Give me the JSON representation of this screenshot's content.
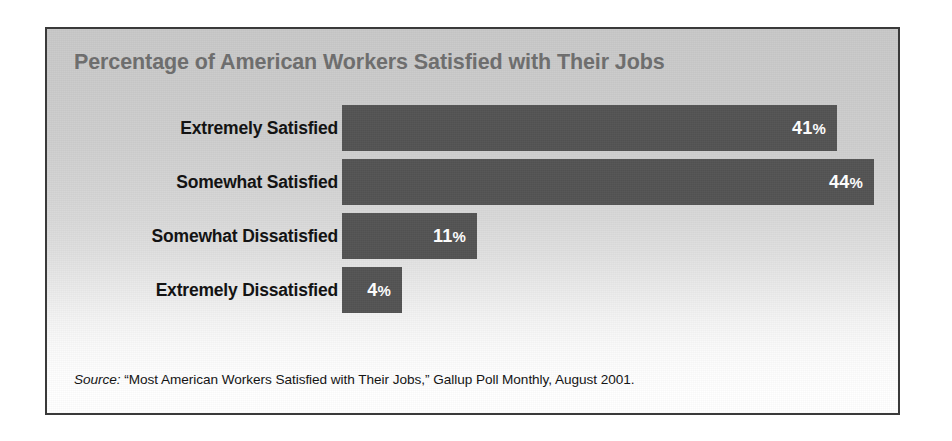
{
  "figure": {
    "title": "Percentage of American Workers Satisfied with Their Jobs",
    "source_label": "Source:",
    "source_text": " “Most American Workers Satisfied with Their Jobs,” Gallup Poll Monthly, August 2001.",
    "frame_color": "#3a3a3a",
    "title_color": "#6e6e6e",
    "bar_color": "#545454",
    "label_color": "#111111",
    "value_color": "#ffffff",
    "background_top": "#c9c9c9",
    "background_bottom": "#ffffff"
  },
  "chart_data": {
    "type": "bar",
    "orientation": "horizontal",
    "title": "Percentage of American Workers Satisfied with Their Jobs",
    "xlabel": "",
    "ylabel": "",
    "xlim": [
      0,
      50
    ],
    "grid": false,
    "legend": "none",
    "categories": [
      "Extremely Satisfied",
      "Somewhat Satisfied",
      "Somewhat Dissatisfied",
      "Extremely Dissatisfied"
    ],
    "values": [
      41,
      44,
      11,
      4
    ],
    "value_labels": [
      "41%",
      "44%",
      "11%",
      "4%"
    ],
    "units": "percent",
    "annotations": [
      "Source: “Most American Workers Satisfied with Their Jobs,” Gallup Poll Monthly, August 2001."
    ]
  },
  "bars": [
    {
      "label": "Extremely Satisfied",
      "value": 41,
      "value_number": "41",
      "value_pct": "%",
      "width_px": 495
    },
    {
      "label": "Somewhat Satisfied",
      "value": 44,
      "value_number": "44",
      "value_pct": "%",
      "width_px": 532
    },
    {
      "label": "Somewhat Dissatisfied",
      "value": 11,
      "value_number": "11",
      "value_pct": "%",
      "width_px": 135
    },
    {
      "label": "Extremely Dissatisfied",
      "value": 4,
      "value_number": "4",
      "value_pct": "%",
      "width_px": 60
    }
  ]
}
